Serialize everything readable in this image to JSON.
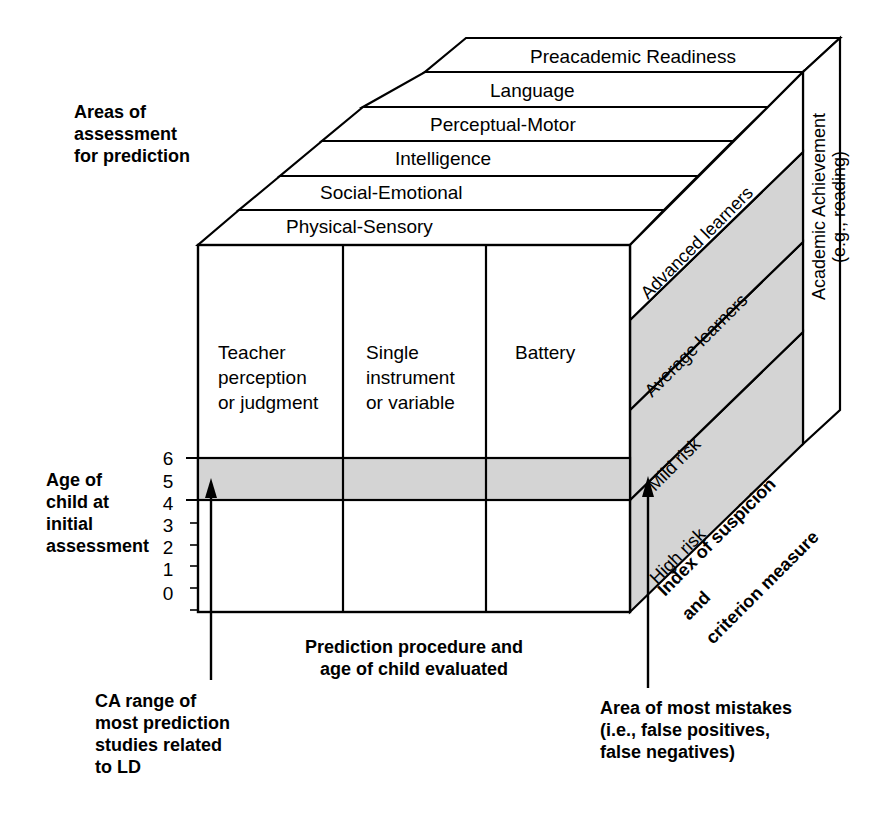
{
  "figure": {
    "type": "three-dimensional-cube-model",
    "colors": {
      "line": "#000000",
      "shade": "#d4d4d4",
      "background": "#ffffff",
      "text": "#000000"
    }
  },
  "axes": {
    "top": {
      "caption_lines": [
        "Areas of",
        "assessment",
        "for prediction"
      ],
      "dimension_name": "Areas of assessment for prediction",
      "bands": [
        "Preacademic Readiness",
        "Language",
        "Perceptual-Motor",
        "Intelligence",
        "Social-Emotional",
        "Physical-Sensory"
      ]
    },
    "left": {
      "caption_lines": [
        "Age of",
        "child at",
        "initial",
        "assessment"
      ],
      "dimension_name": "Age of child at initial assessment",
      "ticks": [
        "6",
        "5",
        "4",
        "3",
        "2",
        "1",
        "0"
      ],
      "highlight_range": [
        "5",
        "6"
      ]
    },
    "front": {
      "caption_lines": [
        "Prediction procedure and",
        "age of child evaluated"
      ],
      "dimension_name": "Prediction procedure and age of child evaluated",
      "columns": [
        {
          "lines": [
            "Teacher",
            "perception",
            "or judgment"
          ]
        },
        {
          "lines": [
            "Single",
            "instrument",
            "or variable"
          ]
        },
        {
          "lines": [
            "Battery"
          ]
        }
      ]
    },
    "right": {
      "caption_lines": [
        "Index of suspicion",
        "and",
        "criterion measure"
      ],
      "dimension_name": "Index of suspicion and criterion measure",
      "outer_label_lines": [
        "Academic Achievement",
        "(e.g., reading)"
      ],
      "bands": [
        {
          "label": "Advanced learners",
          "shaded": false
        },
        {
          "label": "Average learners",
          "shaded": true
        },
        {
          "label": "Mild risk",
          "shaded": true
        },
        {
          "label": "High risk",
          "shaded": true
        }
      ]
    }
  },
  "annotations": [
    {
      "id": "ca-range",
      "lines": [
        "CA range of",
        "most prediction",
        "studies related",
        "to LD"
      ],
      "points_to": "shaded age band on front face"
    },
    {
      "id": "area-of-most-mistakes",
      "lines": [
        "Area of most mistakes",
        "(i.e., false positives,",
        "false negatives)"
      ],
      "points_to": "shaded risk bands on right face"
    }
  ]
}
